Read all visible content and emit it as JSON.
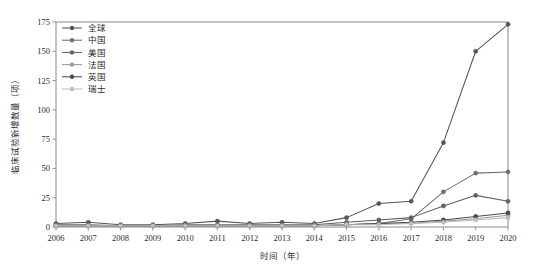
{
  "chart_data": {
    "type": "line",
    "title": "",
    "xlabel": "时间（年）",
    "ylabel": "临床试验新增数量（项）",
    "grid": false,
    "legend_position": "top-left-inside",
    "xlim": [
      2006,
      2020
    ],
    "ylim": [
      0,
      175
    ],
    "yticks": [
      0,
      25,
      50,
      75,
      100,
      125,
      150,
      175
    ],
    "ytick_labels": [
      "0",
      "25",
      "50",
      "75",
      "100",
      "125",
      "150",
      "175"
    ],
    "x": [
      2006,
      2007,
      2008,
      2009,
      2010,
      2011,
      2012,
      2013,
      2014,
      2015,
      2016,
      2017,
      2018,
      2019,
      2020
    ],
    "xtick_labels": [
      "2006",
      "2007",
      "2008",
      "2009",
      "2010",
      "2011",
      "2012",
      "2013",
      "2014",
      "2015",
      "2016",
      "2017",
      "2018",
      "2019",
      "2020"
    ],
    "series": [
      {
        "name": "全球",
        "color": "#555555",
        "marker": "circle",
        "values": [
          3,
          4,
          2,
          2,
          3,
          5,
          3,
          4,
          3,
          8,
          20,
          22,
          72,
          150,
          173
        ]
      },
      {
        "name": "中国",
        "color": "#6f6f6f",
        "marker": "circle",
        "values": [
          1,
          1,
          1,
          1,
          1,
          1,
          1,
          1,
          1,
          2,
          3,
          7,
          30,
          46,
          47
        ]
      },
      {
        "name": "美国",
        "color": "#606060",
        "marker": "circle",
        "values": [
          2,
          2,
          1,
          1,
          2,
          2,
          2,
          2,
          2,
          4,
          6,
          8,
          18,
          27,
          22
        ]
      },
      {
        "name": "法国",
        "color": "#9a9a9a",
        "marker": "circle",
        "values": [
          1,
          1,
          1,
          1,
          1,
          1,
          1,
          1,
          1,
          2,
          3,
          3,
          5,
          7,
          10
        ]
      },
      {
        "name": "英国",
        "color": "#4a4a4a",
        "marker": "circle",
        "values": [
          1,
          1,
          1,
          1,
          1,
          1,
          1,
          1,
          1,
          2,
          3,
          4,
          6,
          9,
          12
        ]
      },
      {
        "name": "瑞士",
        "color": "#bdbdbd",
        "marker": "circle",
        "values": [
          1,
          1,
          1,
          1,
          1,
          1,
          1,
          1,
          1,
          2,
          2,
          3,
          4,
          6,
          8
        ]
      }
    ]
  },
  "legend": {
    "items": [
      {
        "label": "全球"
      },
      {
        "label": "中国"
      },
      {
        "label": "美国"
      },
      {
        "label": "法国"
      },
      {
        "label": "英国"
      },
      {
        "label": "瑞士"
      }
    ]
  }
}
